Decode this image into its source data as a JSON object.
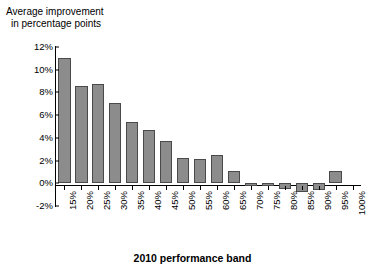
{
  "chart_data": {
    "type": "bar",
    "title": "",
    "ylabel": "Average improvement\nin percentage points",
    "ylabel_lines": [
      "Average improvement",
      "in percentage points"
    ],
    "xlabel": "2010 performance band",
    "categories": [
      "15%",
      "20%",
      "25%",
      "30%",
      "35%",
      "40%",
      "45%",
      "50%",
      "55%",
      "60%",
      "65%",
      "70%",
      "75%",
      "80%",
      "85%",
      "90%",
      "95%",
      "100%"
    ],
    "values": [
      11.0,
      8.6,
      8.7,
      7.1,
      5.4,
      4.7,
      3.7,
      2.2,
      2.1,
      2.5,
      1.1,
      -0.2,
      -0.2,
      -0.5,
      -0.8,
      -0.6,
      1.1,
      0.0
    ],
    "ytick_labels": [
      "12%",
      "10%",
      "8%",
      "6%",
      "4%",
      "2%",
      "0%",
      "-2%"
    ],
    "ytick_values": [
      12,
      10,
      8,
      6,
      4,
      2,
      0,
      -2
    ],
    "ylim": [
      -2,
      12
    ],
    "grid": false,
    "legend": null,
    "bar_color": "#8c8c8c",
    "bar_edge_color": "#4a4a4a",
    "axis_color": "#000000"
  }
}
